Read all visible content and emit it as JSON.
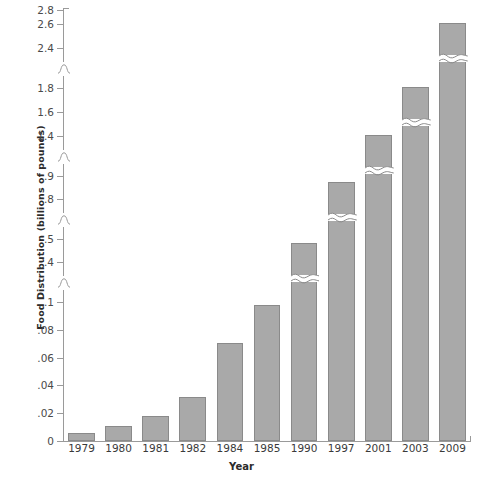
{
  "chart_data": {
    "type": "bar",
    "title": "",
    "xlabel": "Year",
    "ylabel": "Food Distribution (billions of pounds)",
    "categories": [
      "1979",
      "1980",
      "1981",
      "1982",
      "1984",
      "1985",
      "1990",
      "1997",
      "2001",
      "2003",
      "2009"
    ],
    "values": [
      0.005,
      0.01,
      0.017,
      0.031,
      0.07,
      0.097,
      0.48,
      0.87,
      1.4,
      1.8,
      2.6
    ],
    "y_tick_labels": [
      "0",
      ".02",
      ".04",
      ".06",
      ".08",
      ".1",
      ".4",
      ".5",
      ".8",
      ".9",
      "1.4",
      "1.6",
      "1.8",
      "2.4",
      "2.6",
      "2.8"
    ],
    "y_tick_values": [
      0,
      0.02,
      0.04,
      0.06,
      0.08,
      0.1,
      0.4,
      0.5,
      0.8,
      0.9,
      1.4,
      1.6,
      1.8,
      2.4,
      2.6,
      2.8
    ],
    "axis_broken": true,
    "axis_break_count": 4,
    "bars_with_break_marks": [
      "1990",
      "1997",
      "2001",
      "2003",
      "2009"
    ],
    "grid": false,
    "legend": "none",
    "bar_color": "#a9a9a9",
    "bar_border_color": "#8a8a8a",
    "axis_color": "#9a9a9a",
    "background": "#ffffff"
  }
}
